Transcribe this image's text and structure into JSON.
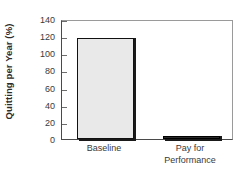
{
  "chart_data": {
    "type": "bar",
    "title": "",
    "xlabel": "",
    "ylabel": "Quitting per Year (%)",
    "categories": [
      "Baseline",
      "Pay for Performance"
    ],
    "category_lines": [
      [
        "Baseline"
      ],
      [
        "Pay for",
        "Performance"
      ]
    ],
    "values": [
      118,
      4
    ],
    "ylim": [
      0,
      140
    ],
    "yticks": [
      0,
      20,
      40,
      60,
      80,
      100,
      120,
      140
    ],
    "ytick_labels": [
      "0",
      "20",
      "40",
      "60",
      "80",
      "100",
      "120",
      "140"
    ],
    "grid": false,
    "legend": null,
    "bar_fill_colors": [
      "#e9e9e9",
      "#2a2a2a"
    ],
    "bar_edge_color": "#111111",
    "axis_color": "#4a4a4a",
    "frame_color": "#9a9a9a",
    "background_color": "#ffffff",
    "text_color": "#3a3a3a"
  }
}
